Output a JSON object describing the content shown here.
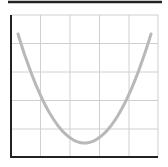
{
  "chart_data": {
    "type": "line",
    "title": "",
    "xlabel": "",
    "ylabel": "",
    "grid": true,
    "grid_columns": 5,
    "grid_rows": 5,
    "legend": null,
    "series": [
      {
        "name": "U-shaped curve",
        "color": "#b8b8b8",
        "x": [
          -1.0,
          -0.75,
          -0.5,
          -0.25,
          0.0,
          0.25,
          0.5,
          0.75,
          1.0
        ],
        "values": [
          1.0,
          0.5625,
          0.25,
          0.0625,
          0.0,
          0.0625,
          0.25,
          0.5625,
          1.0
        ]
      }
    ],
    "colors": {
      "axis": "#222222",
      "grid": "#d0d0d0",
      "top_rule": "#222222",
      "curve": "#b8b8b8"
    }
  }
}
